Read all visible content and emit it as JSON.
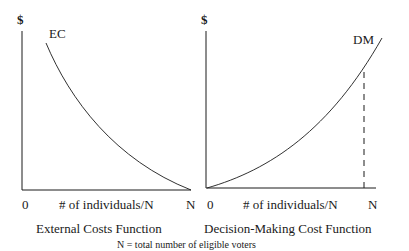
{
  "left_panel": {
    "y_axis_label": "$",
    "curve_label": "EC",
    "origin_label": "0",
    "x_axis_label": "# of individuals/N",
    "x_end_label": "N",
    "title": "External Costs Function"
  },
  "right_panel": {
    "y_axis_label": "$",
    "curve_label": "DM",
    "origin_label": "0",
    "x_axis_label": "# of individuals/N",
    "x_end_label": "N",
    "title": "Decision-Making Cost Function"
  },
  "footnote": "N = total number of eligible voters",
  "colors": {
    "line": "#1a1a1a",
    "background": "#ffffff"
  }
}
